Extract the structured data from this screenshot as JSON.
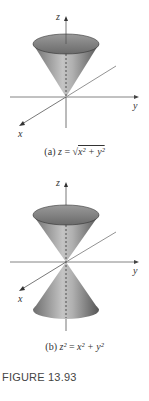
{
  "figure": {
    "title": "FIGURE 13.93",
    "panels": [
      {
        "id": "a",
        "label": "(a)",
        "equation": "z = √(x² + y²)",
        "equation_parts": {
          "lhs": "z",
          "eq": "=",
          "rhs": "x² + y²",
          "sqrt": "√"
        },
        "surface": "upper half-cone",
        "axes": {
          "z": "z",
          "y": "y",
          "x": "x"
        }
      },
      {
        "id": "b",
        "label": "(b)",
        "equation": "z² = x² + y²",
        "equation_parts": {
          "lhs": "z²",
          "eq": "=",
          "rhs": "x² + y²"
        },
        "surface": "double cone",
        "axes": {
          "z": "z",
          "y": "y",
          "x": "x"
        }
      }
    ]
  },
  "colors": {
    "cone_dark": "#5a5a5a",
    "cone_light": "#bdbdbd",
    "ellipse_fill": "#8a8a8a",
    "axis": "#555555",
    "text": "#333333"
  }
}
